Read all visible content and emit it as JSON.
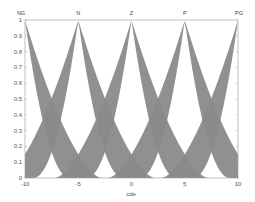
{
  "chart_data": {
    "type": "area",
    "title": "",
    "xlabel": "cde",
    "ylabel": "",
    "xlim": [
      -10,
      10
    ],
    "ylim": [
      0,
      1
    ],
    "grid": false,
    "legend": "none",
    "x_ticks": [
      -10,
      -5,
      0,
      5,
      10
    ],
    "x_tick_labels": [
      "-10",
      "-5",
      "0",
      "5",
      "10"
    ],
    "y_ticks": [
      0,
      0.1,
      0.2,
      0.3,
      0.4,
      0.5,
      0.6,
      0.7,
      0.8,
      0.9,
      1
    ],
    "y_tick_labels": [
      "0",
      "0.1",
      "0.2",
      "0.3",
      "0.4",
      "0.5",
      "0.6",
      "0.7",
      "0.8",
      "0.9",
      "1"
    ],
    "fill_color": "#8a8a8a",
    "membership_functions": [
      {
        "name": "NG",
        "center": -10,
        "upper_width": 7.2,
        "lower_width": 4.2,
        "peak": 1
      },
      {
        "name": "N",
        "center": -5,
        "upper_width": 7.2,
        "lower_width": 4.2,
        "peak": 1
      },
      {
        "name": "Z",
        "center": 0,
        "upper_width": 7.2,
        "lower_width": 4.2,
        "peak": 1
      },
      {
        "name": "P",
        "center": 5,
        "upper_width": 7.2,
        "lower_width": 4.2,
        "peak": 1
      },
      {
        "name": "PG",
        "center": 10,
        "upper_width": 7.2,
        "lower_width": 4.2,
        "peak": 1
      }
    ],
    "series": [
      {
        "name": "NG",
        "type": "interval-type-2-fuzzy-set",
        "center": -10
      },
      {
        "name": "N",
        "type": "interval-type-2-fuzzy-set",
        "center": -5
      },
      {
        "name": "Z",
        "type": "interval-type-2-fuzzy-set",
        "center": 0
      },
      {
        "name": "P",
        "type": "interval-type-2-fuzzy-set",
        "center": 5
      },
      {
        "name": "PG",
        "type": "interval-type-2-fuzzy-set",
        "center": 10
      }
    ]
  },
  "labels": {
    "xlabel": "cde",
    "mf_names": [
      "NG",
      "N",
      "Z",
      "P",
      "PG"
    ]
  }
}
